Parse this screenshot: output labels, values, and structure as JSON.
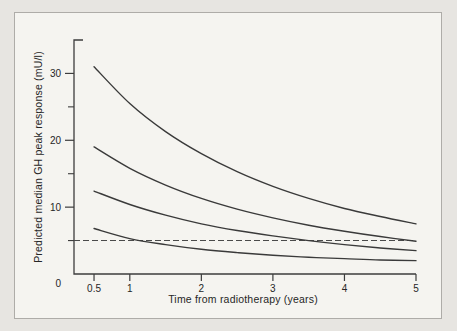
{
  "figure": {
    "outer_background": "#e7e5e1",
    "inner_background": "#f5f4f0",
    "frame_border_color": "#aeaca8",
    "curve_color": "#3a3a3a",
    "axis_color": "#3d3d3d",
    "dashed_line_color": "#4a4a4a",
    "text_color": "#262626"
  },
  "chart_data": {
    "type": "line",
    "title": "",
    "xlabel": "Time from radiotherapy (years)",
    "ylabel": "Predicted median GH peak response (mU/l)",
    "xlim": [
      0.22,
      5.0
    ],
    "ylim": [
      0,
      35
    ],
    "grid": false,
    "legend": "none",
    "x_ticks": [
      0.5,
      1,
      2,
      3,
      4,
      5
    ],
    "x_tick_labels": [
      "0.5",
      "1",
      "2",
      "3",
      "4",
      "5"
    ],
    "y_major_ticks": [
      10,
      20,
      30
    ],
    "y_major_tick_labels": [
      "10",
      "20",
      "30"
    ],
    "y_minor_ticks": [
      5,
      15,
      25
    ],
    "origin_label": "0",
    "x": [
      0.5,
      1,
      1.5,
      2,
      2.5,
      3,
      3.5,
      4,
      4.5,
      5
    ],
    "series": [
      {
        "name": "curve-1",
        "style": "solid",
        "values": [
          31.0,
          25.5,
          21.3,
          18.0,
          15.3,
          13.1,
          11.3,
          9.8,
          8.6,
          7.5
        ]
      },
      {
        "name": "curve-2",
        "style": "solid",
        "values": [
          19.0,
          15.8,
          13.3,
          11.3,
          9.7,
          8.4,
          7.3,
          6.4,
          5.6,
          4.9
        ]
      },
      {
        "name": "curve-3",
        "style": "solid",
        "values": [
          12.4,
          10.4,
          8.8,
          7.5,
          6.5,
          5.7,
          5.0,
          4.4,
          3.9,
          3.5
        ]
      },
      {
        "name": "curve-4",
        "style": "solid",
        "values": [
          6.8,
          5.3,
          4.4,
          3.7,
          3.2,
          2.8,
          2.5,
          2.3,
          2.1,
          2.0
        ]
      }
    ],
    "reference_line": {
      "name": "threshold-dashed-line",
      "value": 5,
      "style": "dashed"
    }
  }
}
